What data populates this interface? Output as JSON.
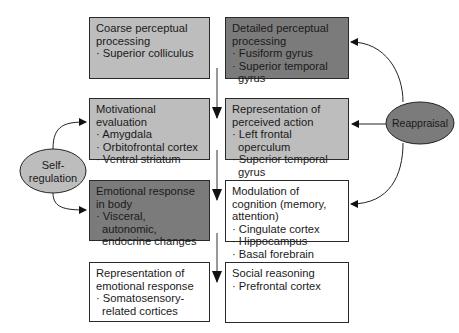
{
  "diagram": {
    "boxes": [
      {
        "id": "coarse",
        "title": "Coarse perceptual processing",
        "items": [
          "· Superior colliculus"
        ],
        "fill": "#bdbdbd"
      },
      {
        "id": "detailed",
        "title": "Detailed perceptual processing",
        "items": [
          "· Fusiform gyrus",
          "· Superior temporal gyrus"
        ],
        "fill": "#7b7b7b"
      },
      {
        "id": "motivational",
        "title": "Motivational evaluation",
        "items": [
          "· Amygdala",
          "· Orbitofrontal cortex",
          "· Ventral striatum"
        ],
        "fill": "#bdbdbd"
      },
      {
        "id": "perceived-action",
        "title": "Representation of perceived action",
        "items": [
          "· Left frontal operculum",
          "· Superior temporal gyrus"
        ],
        "fill": "#bdbdbd"
      },
      {
        "id": "emotional-body",
        "title": "Emotional response in body",
        "items": [
          "· Visceral, autonomic, endocrine changes"
        ],
        "fill": "#7b7b7b"
      },
      {
        "id": "modulation",
        "title": "Modulation of cognition (memory, attention)",
        "items": [
          "· Cingulate cortex",
          "· Hippocampus",
          "· Basal forebrain"
        ],
        "fill": "#ffffff"
      },
      {
        "id": "emotional-representation",
        "title": "Representation of emotional response",
        "items": [
          "· Somatosensory-related cortices"
        ],
        "fill": "#ffffff"
      },
      {
        "id": "social",
        "title": "Social reasoning",
        "items": [
          "· Prefrontal cortex"
        ],
        "fill": "#ffffff"
      }
    ],
    "nodes": [
      {
        "id": "self-regulation",
        "label": "Self-regulation",
        "line1": "Self-",
        "line2": "regulation",
        "fill": "#bdbdbd"
      },
      {
        "id": "reappraisal",
        "label": "Reappraisal",
        "fill": "#7b7b7b"
      }
    ],
    "edges": [
      {
        "from": "column-center",
        "to": "row-2",
        "type": "down-arrow"
      },
      {
        "from": "column-center",
        "to": "row-3",
        "type": "down-arrow"
      },
      {
        "from": "column-center",
        "to": "row-4",
        "type": "down-arrow"
      },
      {
        "from": "self-regulation",
        "to": "motivational"
      },
      {
        "from": "self-regulation",
        "to": "emotional-body"
      },
      {
        "from": "reappraisal",
        "to": "detailed"
      },
      {
        "from": "reappraisal",
        "to": "perceived-action"
      },
      {
        "from": "reappraisal",
        "to": "modulation"
      }
    ]
  }
}
